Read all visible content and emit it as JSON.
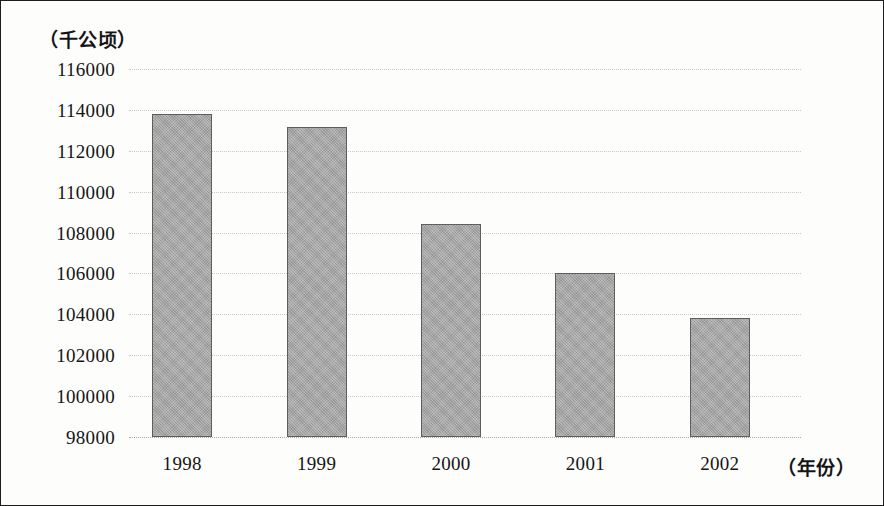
{
  "chart_data": {
    "type": "bar",
    "title": "",
    "subtitle": "",
    "xlabel": "（年份）",
    "ylabel": "（千公顷）",
    "categories": [
      "1998",
      "1999",
      "2000",
      "2001",
      "2002"
    ],
    "values": [
      113800,
      113150,
      108400,
      106000,
      103800
    ],
    "series": [
      {
        "name": "",
        "values": [
          113800,
          113150,
          108400,
          106000,
          103800
        ]
      }
    ],
    "ylim": [
      98000,
      116000
    ],
    "ytick_step": 2000,
    "ytick_labels": [
      "116000",
      "114000",
      "112000",
      "110000",
      "108000",
      "106000",
      "104000",
      "102000",
      "100000",
      "98000"
    ],
    "ytick_values": [
      116000,
      114000,
      112000,
      110000,
      108000,
      106000,
      104000,
      102000,
      100000,
      98000
    ],
    "grid": true,
    "grid_style": "dotted-horizontal",
    "legend": false,
    "legend_position": "none",
    "bar_color": "#a5a5a5",
    "bar_border_color": "#5e5e5e",
    "gridline_color": "#c9c9c9",
    "text_color": "#151515",
    "background_color": "#fdfdfc",
    "annotations": []
  }
}
